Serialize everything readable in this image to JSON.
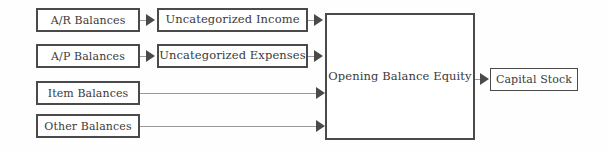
{
  "diagram": {
    "background_color": "#fefefe",
    "node_border_color": "#4a4a4a",
    "edge_line_color": "#9a9a9a",
    "arrowhead_color": "#4a4a4a",
    "text_color": "#3a3a3a",
    "sources": [
      {
        "id": "ar-balances",
        "label": "A/R Balances"
      },
      {
        "id": "ap-balances",
        "label": "A/P Balances"
      },
      {
        "id": "item-balances",
        "label": "Item Balances"
      },
      {
        "id": "other-balances",
        "label": "Other Balances"
      }
    ],
    "intermediates": [
      {
        "id": "uncategorized-income",
        "label": "Uncategorized Income"
      },
      {
        "id": "uncategorized-expenses",
        "label": "Uncategorized Expenses"
      }
    ],
    "hub": {
      "id": "opening-balance-equity",
      "label": "Opening Balance Equity"
    },
    "terminal": {
      "id": "capital-stock",
      "label": "Capital Stock"
    },
    "edges": [
      {
        "id": "e1",
        "from": "A/R Balances",
        "to": "Uncategorized Income",
        "style": "arrow"
      },
      {
        "id": "e2",
        "from": "A/P Balances",
        "to": "Uncategorized Expenses",
        "style": "arrow"
      },
      {
        "id": "e3",
        "from": "Uncategorized Income",
        "to": "Opening Balance Equity",
        "style": "arrow"
      },
      {
        "id": "e4",
        "from": "Uncategorized Expenses",
        "to": "Opening Balance Equity",
        "style": "arrow"
      },
      {
        "id": "e5",
        "from": "Item Balances",
        "to": "Opening Balance Equity",
        "style": "arrow"
      },
      {
        "id": "e6",
        "from": "Other Balances",
        "to": "Opening Balance Equity",
        "style": "arrow"
      },
      {
        "id": "e7",
        "from": "Opening Balance Equity",
        "to": "Capital Stock",
        "style": "arrow"
      }
    ]
  }
}
